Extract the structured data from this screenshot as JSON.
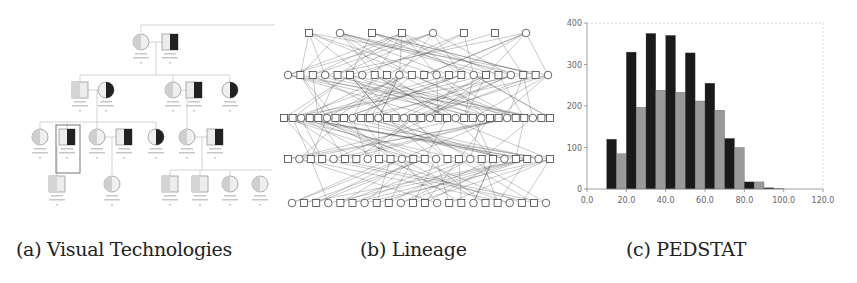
{
  "figure": {
    "panels": [
      {
        "label": "(a)",
        "caption": "Visual Technologies"
      },
      {
        "label": "(b)",
        "caption": "Lineage"
      },
      {
        "label": "(c)",
        "caption": "PEDSTAT"
      }
    ]
  },
  "captions": {
    "a": "(a) Visual Technologies",
    "b": "(b) Lineage",
    "c": "(c) PEDSTAT"
  },
  "chart_data": {
    "type": "bar",
    "title": "",
    "xlabel": "",
    "ylabel": "",
    "x_ticks": [
      "0.0",
      "20.0",
      "40.0",
      "60.0",
      "80.0",
      "100.0",
      "120.0"
    ],
    "y_ticks": [
      "0",
      "100",
      "200",
      "300",
      "400"
    ],
    "xlim": [
      0,
      120
    ],
    "ylim": [
      0,
      400
    ],
    "bin_starts": [
      10,
      20,
      30,
      40,
      50,
      60,
      70,
      80,
      90
    ],
    "series": [
      {
        "name": "dark",
        "color": "#1a1a1a",
        "values": [
          120,
          330,
          375,
          370,
          328,
          255,
          122,
          17,
          3
        ]
      },
      {
        "name": "gray",
        "color": "#9a9a9a",
        "values": [
          85,
          197,
          238,
          233,
          212,
          190,
          100,
          17,
          2
        ]
      }
    ],
    "grid": false,
    "legend": null
  }
}
